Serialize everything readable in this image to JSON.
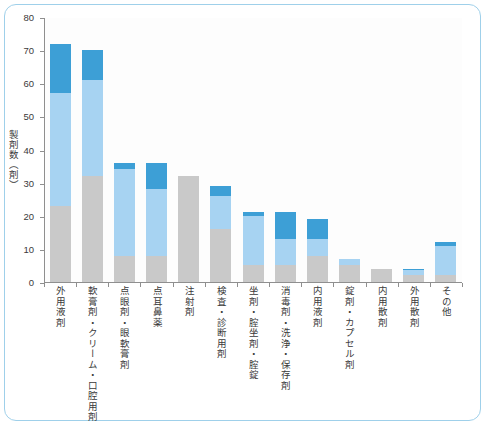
{
  "chart_data": {
    "type": "bar",
    "subtype": "stacked-bar-vertical",
    "title": "",
    "xlabel": "",
    "ylabel": "製剤数（剤）",
    "ylim": [
      0,
      80
    ],
    "yticks": [
      0,
      10,
      20,
      30,
      40,
      50,
      60,
      70,
      80
    ],
    "grid": false,
    "legend_position": "right-inside",
    "categories": [
      "外用液剤",
      "軟膏剤・クリーム・口腔用剤",
      "点眼剤・眼軟膏剤",
      "点耳鼻薬",
      "注射剤",
      "検査・診断用剤",
      "坐剤・腟坐剤・腟錠",
      "消毒剤・洗浄・保存剤",
      "内用液剤",
      "錠剤・カプセル剤",
      "内用散剤",
      "外用散剤",
      "その他"
    ],
    "series": [
      {
        "name": "クラスⅠ",
        "color": "#c9c9c9",
        "values": [
          23,
          32,
          8,
          8,
          32,
          16,
          5,
          5,
          8,
          5,
          4,
          2,
          2
        ]
      },
      {
        "name": "クラスⅡ",
        "color": "#a7d3f2",
        "values": [
          34,
          29,
          26,
          20,
          0,
          10,
          15,
          8,
          5,
          2,
          0,
          1.5,
          9
        ]
      },
      {
        "name": "クラスⅢ",
        "color": "#3d9fd6",
        "values": [
          15,
          9,
          2,
          8,
          0,
          3,
          1,
          8,
          6,
          0,
          0,
          0.5,
          1
        ]
      }
    ],
    "totals": [
      72,
      70,
      36,
      36,
      32,
      29,
      21,
      21,
      19,
      7,
      4,
      4,
      12
    ],
    "annotation": [
      "2011，2012 年調査",
      "全国 250 床以上の 715 施設対象",
      "代表 364 製剤"
    ]
  },
  "legend": {
    "items": [
      {
        "label": "クラスⅢ",
        "color": "#3d9fd6"
      },
      {
        "label": "クラスⅡ",
        "color": "#a7d3f2"
      },
      {
        "label": "クラスⅠ",
        "color": "#c9c9c9"
      }
    ]
  },
  "frame": {
    "border_color": "#9fd0ea",
    "background": "#ffffff"
  }
}
